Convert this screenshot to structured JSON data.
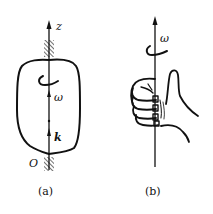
{
  "figure_a": {
    "caption": "(a)",
    "axis_label": "z",
    "omega_label": "ω",
    "unit_vector_label": "k",
    "origin_label": "O"
  },
  "figure_b": {
    "caption": "(b)",
    "omega_label": "ω"
  },
  "colors": {
    "stroke": "#111111",
    "background": "#ffffff"
  }
}
